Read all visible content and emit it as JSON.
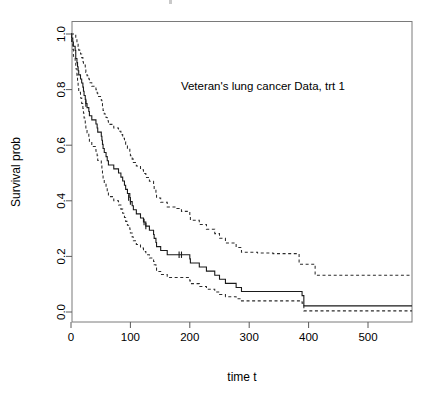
{
  "figure": {
    "background_color": "#ffffff",
    "foreground_color": "#000000",
    "frame_color": "#7a7a7a",
    "annotation": "Veteran's lung cancer Data, trt 1",
    "cut_off_title_fragment": ""
  },
  "chart_data": {
    "type": "line",
    "subtype": "kaplan-meier-step",
    "title": "",
    "annotations": [
      {
        "text": "Veteran's lung cancer Data, trt 1",
        "x": 185,
        "y": 0.8,
        "halign": "left"
      }
    ],
    "xlabel": "time t",
    "ylabel": "Survival prob",
    "xlim": [
      -12,
      574
    ],
    "ylim": [
      -0.03,
      1.05
    ],
    "xticks": [
      0,
      100,
      200,
      300,
      400,
      500
    ],
    "xticklabels": [
      "0",
      "100",
      "200",
      "300",
      "400",
      "500"
    ],
    "yticks": [
      0.0,
      0.2,
      0.4,
      0.6,
      0.8,
      1.0
    ],
    "yticklabels": [
      "0.0",
      "0.2",
      "0.4",
      "0.6",
      "0.8",
      "1.0"
    ],
    "grid": false,
    "legend": null,
    "legend_position": "none",
    "series": [
      {
        "name": "Survival estimate",
        "style": "solid",
        "color": "#1a1a1a",
        "x": [
          0,
          1,
          3,
          4,
          7,
          8,
          8,
          10,
          11,
          12,
          13,
          16,
          18,
          20,
          21,
          22,
          24,
          25,
          27,
          30,
          31,
          35,
          36,
          42,
          44,
          45,
          51,
          52,
          53,
          54,
          56,
          59,
          61,
          63,
          72,
          80,
          82,
          84,
          87,
          90,
          92,
          95,
          99,
          100,
          103,
          105,
          110,
          117,
          118,
          122,
          126,
          132,
          139,
          140,
          143,
          144,
          151,
          153,
          156,
          162,
          164,
          177,
          182,
          186,
          200,
          201,
          216,
          228,
          231,
          242,
          250,
          260,
          278,
          283,
          287,
          314,
          340,
          357,
          378,
          384,
          389,
          392,
          411,
          467,
          553,
          574
        ],
        "y": [
          1.0,
          0.985,
          0.971,
          0.956,
          0.941,
          0.926,
          0.912,
          0.897,
          0.882,
          0.868,
          0.853,
          0.838,
          0.824,
          0.809,
          0.794,
          0.779,
          0.765,
          0.75,
          0.735,
          0.721,
          0.706,
          0.691,
          0.691,
          0.676,
          0.662,
          0.647,
          0.632,
          0.618,
          0.603,
          0.588,
          0.574,
          0.559,
          0.544,
          0.529,
          0.515,
          0.5,
          0.5,
          0.485,
          0.471,
          0.456,
          0.441,
          0.426,
          0.412,
          0.397,
          0.382,
          0.368,
          0.353,
          0.338,
          0.338,
          0.324,
          0.309,
          0.294,
          0.279,
          0.265,
          0.25,
          0.235,
          0.221,
          0.221,
          0.221,
          0.206,
          0.206,
          0.206,
          0.206,
          0.206,
          0.191,
          0.176,
          0.162,
          0.147,
          0.147,
          0.132,
          0.118,
          0.103,
          0.088,
          0.088,
          0.074,
          0.074,
          0.074,
          0.074,
          0.074,
          0.074,
          0.059,
          0.022,
          0.022,
          0.022,
          0.022,
          0.022
        ]
      },
      {
        "name": "Upper confidence band",
        "style": "dashed",
        "color": "#2b2b2b",
        "x": [
          0,
          3,
          7,
          8,
          10,
          12,
          13,
          16,
          18,
          20,
          21,
          24,
          25,
          27,
          30,
          31,
          35,
          36,
          42,
          44,
          45,
          51,
          52,
          53,
          54,
          56,
          59,
          61,
          63,
          72,
          80,
          82,
          84,
          87,
          90,
          92,
          95,
          99,
          100,
          103,
          105,
          110,
          117,
          118,
          122,
          126,
          132,
          139,
          140,
          143,
          144,
          151,
          153,
          156,
          162,
          164,
          177,
          182,
          186,
          200,
          201,
          216,
          228,
          231,
          242,
          250,
          260,
          278,
          283,
          287,
          314,
          340,
          357,
          378,
          384,
          389,
          392,
          411,
          467,
          553,
          574
        ],
        "y": [
          1.0,
          1.0,
          0.998,
          0.985,
          0.97,
          0.955,
          0.942,
          0.928,
          0.915,
          0.9,
          0.888,
          0.875,
          0.862,
          0.85,
          0.838,
          0.825,
          0.812,
          0.812,
          0.8,
          0.788,
          0.775,
          0.762,
          0.75,
          0.738,
          0.725,
          0.712,
          0.7,
          0.688,
          0.675,
          0.662,
          0.65,
          0.65,
          0.638,
          0.625,
          0.612,
          0.6,
          0.588,
          0.575,
          0.562,
          0.55,
          0.538,
          0.525,
          0.512,
          0.512,
          0.498,
          0.484,
          0.47,
          0.455,
          0.44,
          0.425,
          0.41,
          0.395,
          0.395,
          0.395,
          0.378,
          0.378,
          0.372,
          0.368,
          0.362,
          0.345,
          0.33,
          0.315,
          0.298,
          0.298,
          0.282,
          0.265,
          0.248,
          0.232,
          0.232,
          0.215,
          0.212,
          0.21,
          0.21,
          0.21,
          0.172,
          0.172,
          0.172,
          0.132,
          0.132,
          0.132,
          0.132
        ]
      },
      {
        "name": "Lower confidence band",
        "style": "dashed",
        "color": "#2b2b2b",
        "x": [
          0,
          1,
          3,
          4,
          7,
          8,
          10,
          11,
          12,
          13,
          16,
          18,
          20,
          21,
          22,
          24,
          25,
          27,
          30,
          31,
          35,
          36,
          42,
          44,
          45,
          51,
          52,
          53,
          54,
          56,
          59,
          61,
          63,
          72,
          80,
          82,
          84,
          87,
          90,
          92,
          95,
          99,
          100,
          103,
          105,
          110,
          117,
          118,
          122,
          126,
          132,
          139,
          140,
          143,
          144,
          151,
          153,
          156,
          162,
          164,
          177,
          182,
          186,
          200,
          201,
          216,
          228,
          231,
          242,
          250,
          260,
          278,
          283,
          287,
          314,
          340,
          357,
          378,
          384,
          389,
          392,
          411,
          467,
          553,
          574
        ],
        "y": [
          1.0,
          0.97,
          0.945,
          0.92,
          0.898,
          0.875,
          0.852,
          0.83,
          0.81,
          0.79,
          0.77,
          0.75,
          0.732,
          0.715,
          0.698,
          0.68,
          0.662,
          0.645,
          0.628,
          0.612,
          0.595,
          0.595,
          0.578,
          0.562,
          0.545,
          0.528,
          0.512,
          0.495,
          0.478,
          0.462,
          0.446,
          0.43,
          0.415,
          0.4,
          0.385,
          0.385,
          0.37,
          0.355,
          0.34,
          0.326,
          0.312,
          0.298,
          0.284,
          0.27,
          0.256,
          0.243,
          0.23,
          0.23,
          0.218,
          0.206,
          0.194,
          0.182,
          0.17,
          0.158,
          0.146,
          0.135,
          0.135,
          0.135,
          0.124,
          0.124,
          0.124,
          0.124,
          0.124,
          0.112,
          0.102,
          0.092,
          0.082,
          0.082,
          0.072,
          0.063,
          0.055,
          0.048,
          0.048,
          0.04,
          0.04,
          0.04,
          0.04,
          0.04,
          0.04,
          0.032,
          0.004,
          0.004,
          0.004,
          0.004,
          0.004
        ]
      }
    ],
    "censor_marks": [
      {
        "x": 25,
        "y": 0.75
      },
      {
        "x": 97,
        "y": 0.412
      },
      {
        "x": 100,
        "y": 0.397
      },
      {
        "x": 123,
        "y": 0.324
      },
      {
        "x": 126,
        "y": 0.309
      },
      {
        "x": 182,
        "y": 0.206
      },
      {
        "x": 186,
        "y": 0.206
      }
    ]
  }
}
